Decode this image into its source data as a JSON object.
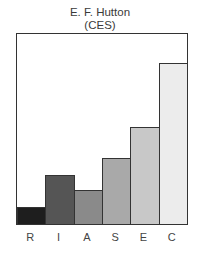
{
  "chart_data": {
    "type": "bar",
    "title": "E. F. Hutton",
    "subtitle": "(CES)",
    "categories": [
      "R",
      "I",
      "A",
      "S",
      "E",
      "C"
    ],
    "values": [
      9,
      26,
      18,
      35,
      51,
      85
    ],
    "colors": [
      "#1e1e1e",
      "#555555",
      "#8a8a8a",
      "#a9a9a9",
      "#c8c8c8",
      "#ececec"
    ],
    "xlabel": "",
    "ylabel": "",
    "ylim": [
      0,
      100
    ],
    "grid": false,
    "legend": "none"
  }
}
